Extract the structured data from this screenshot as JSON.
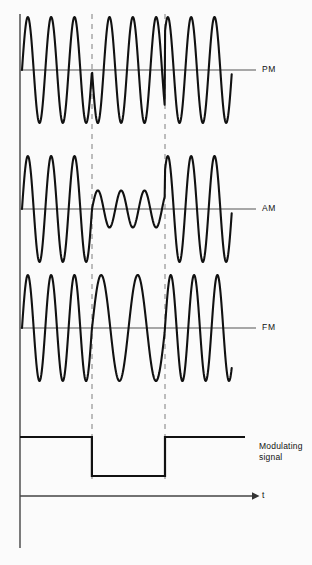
{
  "figure": {
    "background_color": "#fbfbfb",
    "trace_color": "#111111",
    "axis_color": "#555555",
    "dashed_color": "#999999",
    "width": 312,
    "height": 565
  },
  "labels": {
    "pm": "PM",
    "am": "AM",
    "fm": "FM",
    "modulating": "Modulating\nsignal",
    "time_axis": "t"
  },
  "caption": "",
  "geometry": {
    "axis_x": 20,
    "wave_start_x": 22,
    "wave_end_x": 232,
    "baseline_end_x": 256,
    "dash_x1": 92,
    "dash_x2": 165,
    "dash_top": 14,
    "dash_bottom": 480,
    "pm_baseline_y": 70,
    "am_baseline_y": 209,
    "fm_baseline_y": 328,
    "mod_high_y": 437,
    "mod_low_y": 476,
    "t_axis_y": 496,
    "vaxis_top": 14,
    "vaxis_bottom": 548,
    "amplitude": 53
  },
  "chart_data": {
    "type": "line",
    "xlabel": "t",
    "ylabel": "",
    "grid": false,
    "legend": "right-of-trace",
    "annotations": [
      "Dashed vertical markers at the two modulating-signal transitions",
      "PM carrier shows 180 degree phase reversal at each transition",
      "AM carrier amplitude drops while the modulating signal is low",
      "FM carrier frequency drops while the modulating signal is low"
    ],
    "series": [
      {
        "name": "PM",
        "description": "Constant amplitude, constant frequency carrier with 180 degree phase inversion on each modulating transition",
        "carrier_cycles_total": 9,
        "amplitude": 1.0,
        "frequency_normalized": 1.0,
        "phase_segments": [
          {
            "region": "high",
            "t_start": 0.0,
            "t_end": 0.333,
            "phase_deg": 0
          },
          {
            "region": "low",
            "t_start": 0.333,
            "t_end": 0.681,
            "phase_deg": 180
          },
          {
            "region": "high",
            "t_start": 0.681,
            "t_end": 1.0,
            "phase_deg": 0
          }
        ]
      },
      {
        "name": "AM",
        "description": "Constant frequency carrier whose amplitude follows the modulating signal",
        "carrier_cycles_total": 9,
        "frequency_normalized": 1.0,
        "amplitude_segments": [
          {
            "region": "high",
            "t_start": 0.0,
            "t_end": 0.333,
            "amplitude": 1.0
          },
          {
            "region": "low",
            "t_start": 0.333,
            "t_end": 0.681,
            "amplitude": 0.35
          },
          {
            "region": "high",
            "t_start": 0.681,
            "t_end": 1.0,
            "amplitude": 1.0
          }
        ]
      },
      {
        "name": "FM",
        "description": "Constant amplitude carrier whose frequency follows the modulating signal",
        "amplitude": 1.0,
        "frequency_segments": [
          {
            "region": "high",
            "t_start": 0.0,
            "t_end": 0.333,
            "frequency_normalized": 1.0,
            "cycles": 3
          },
          {
            "region": "low",
            "t_start": 0.333,
            "t_end": 0.681,
            "frequency_normalized": 0.667,
            "cycles": 2
          },
          {
            "region": "high",
            "t_start": 0.681,
            "t_end": 1.0,
            "frequency_normalized": 1.0,
            "cycles": 3
          }
        ]
      },
      {
        "name": "Modulating signal",
        "description": "Binary square wave, high-low-high",
        "levels": [
          {
            "t_start": 0.0,
            "t_end": 0.333,
            "level": "high"
          },
          {
            "t_start": 0.333,
            "t_end": 0.681,
            "level": "low"
          },
          {
            "t_start": 0.681,
            "t_end": 1.0,
            "level": "high"
          }
        ]
      }
    ]
  }
}
